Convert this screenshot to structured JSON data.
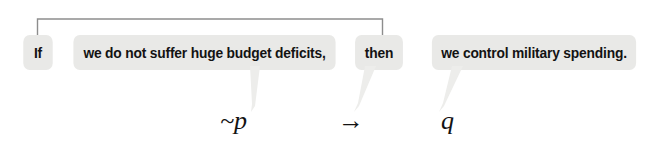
{
  "diagram": {
    "type": "logic-statement-breakdown",
    "chips": [
      {
        "id": "if",
        "label": "If"
      },
      {
        "id": "antecedent",
        "label": "we do not suffer huge budget deficits,"
      },
      {
        "id": "then",
        "label": "then"
      },
      {
        "id": "consequent",
        "label": "we control military spending."
      }
    ],
    "symbols": [
      {
        "id": "antecedent-symbol",
        "label": "~p"
      },
      {
        "id": "connective-symbol",
        "label": "→"
      },
      {
        "id": "consequent-symbol",
        "label": "q"
      }
    ],
    "bracket": {
      "name": "conditional-connective-bracket",
      "spans_from": "If",
      "spans_to": "then"
    },
    "colors": {
      "chip_background": "#e9e9e7",
      "text": "#131313",
      "bracket": "#8d8d8d",
      "tail": "#ededeb",
      "page_background": "#ffffff"
    }
  }
}
